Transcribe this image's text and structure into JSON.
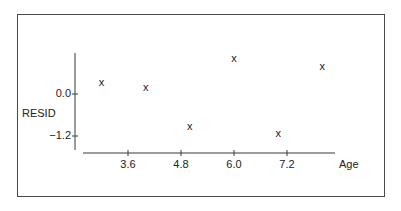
{
  "chart_data": {
    "type": "scatter",
    "title": "",
    "xlabel": "Age",
    "ylabel": "RESID",
    "marker": "x",
    "x_ticks": [
      "3.6",
      "4.8",
      "6.0",
      "7.2"
    ],
    "y_ticks": [
      "0.0",
      "-1.2"
    ],
    "xlim": [
      2.6,
      8.3
    ],
    "ylim": [
      -1.6,
      1.2
    ],
    "grid": false,
    "legend": null,
    "points": [
      {
        "x": 3.0,
        "y": 0.34
      },
      {
        "x": 4.0,
        "y": 0.2
      },
      {
        "x": 5.0,
        "y": -0.91
      },
      {
        "x": 6.0,
        "y": 1.03
      },
      {
        "x": 7.0,
        "y": -1.11
      },
      {
        "x": 8.0,
        "y": 0.8
      }
    ]
  },
  "labels": {
    "ylabel": "RESID",
    "xlabel": "Age",
    "yticks": [
      "0.0",
      "−1.2"
    ],
    "xticks": [
      "3.6",
      "4.8",
      "6.0",
      "7.2"
    ],
    "marker_glyph": "x"
  },
  "colors": {
    "axis": "#3a3a3a",
    "frame": "#4a4a4a",
    "marker": "#1a1a1a"
  }
}
